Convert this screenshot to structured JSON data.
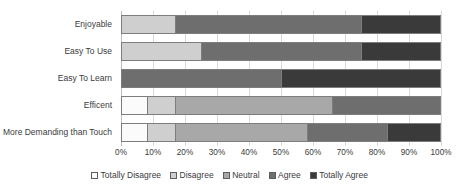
{
  "chart_data": {
    "type": "bar",
    "orientation": "horizontal",
    "stacked": true,
    "normalized_percent": true,
    "title": "",
    "xlabel": "",
    "ylabel": "",
    "xlim": [
      0,
      100
    ],
    "grid": true,
    "legend_position": "bottom",
    "categories": [
      "Enjoyable",
      "Easy To Use",
      "Easy To Learn",
      "Efficent",
      "More Demanding than Touch"
    ],
    "xticks": [
      "0%",
      "10%",
      "20%",
      "30%",
      "40%",
      "50%",
      "60%",
      "70%",
      "80%",
      "90%",
      "100%"
    ],
    "xtick_values": [
      0,
      10,
      20,
      30,
      40,
      50,
      60,
      70,
      80,
      90,
      100
    ],
    "series": [
      {
        "name": "Totally Disagree",
        "color": "#fbfbfb",
        "values": [
          0,
          0,
          0,
          8,
          8
        ]
      },
      {
        "name": "Disagree",
        "color": "#cfcfcf",
        "values": [
          17,
          25,
          0,
          9,
          9
        ]
      },
      {
        "name": "Neutral",
        "color": "#a8a8a8",
        "values": [
          0,
          0,
          0,
          49,
          41
        ]
      },
      {
        "name": "Agree",
        "color": "#6e6e6e",
        "values": [
          58,
          50,
          50,
          34,
          25
        ]
      },
      {
        "name": "Totally Agree",
        "color": "#3a3a3a",
        "values": [
          25,
          25,
          50,
          0,
          17
        ]
      }
    ]
  }
}
